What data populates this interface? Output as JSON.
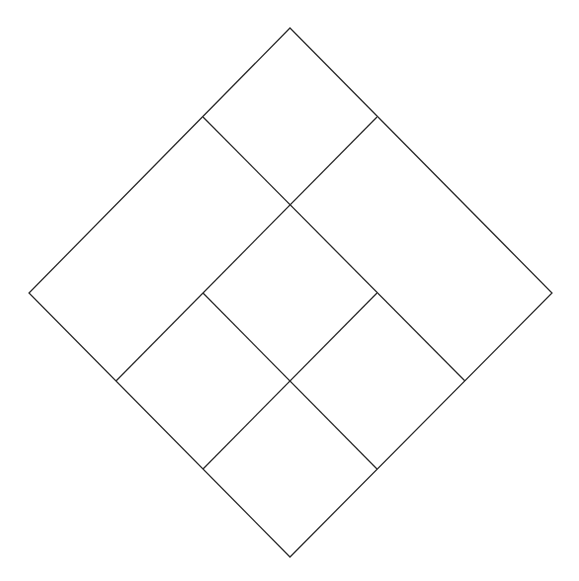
{
  "diagram": {
    "stroke_color": "#2b2b2b",
    "stroke_width": 1.3,
    "background": "#ffffff",
    "outer_diamond": {
      "top": [
        290,
        28
      ],
      "right": [
        552,
        293
      ],
      "bottom": [
        290,
        557
      ],
      "left": [
        29,
        293
      ]
    },
    "internal_segments": [
      {
        "from": [
          203,
          117
        ],
        "to": [
          465,
          381
        ]
      },
      {
        "from": [
          377,
          117
        ],
        "to": [
          116,
          381
        ]
      },
      {
        "from": [
          203,
          293
        ],
        "to": [
          377,
          469
        ]
      },
      {
        "from": [
          377,
          293
        ],
        "to": [
          203,
          469
        ]
      }
    ],
    "junctions": [
      [
        203,
        117
      ],
      [
        377,
        117
      ],
      [
        290,
        205
      ],
      [
        203,
        293
      ],
      [
        377,
        293
      ],
      [
        116,
        381
      ],
      [
        290,
        381
      ],
      [
        465,
        381
      ],
      [
        203,
        469
      ],
      [
        377,
        469
      ]
    ],
    "regions_count": 7
  }
}
